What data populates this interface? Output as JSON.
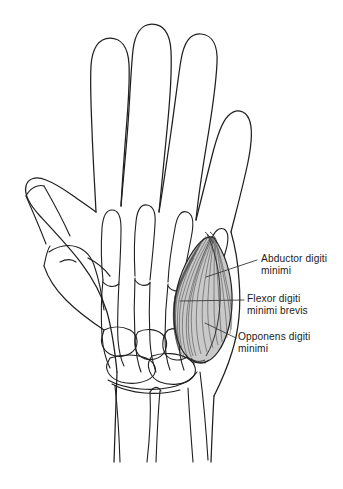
{
  "figure": {
    "view": "palmar view of right hand skeleton with hand outline",
    "background_color": "#ffffff",
    "ink_color": "#1a1a1a",
    "muscle_fill_color": "#b4b4b4"
  },
  "labels": [
    {
      "id": "abductor",
      "name": "abductor-digiti-minimi",
      "line1": "Abductor digiti",
      "line2": "minimi",
      "full_text": "Abductor digiti minimi",
      "leader": {
        "x1": 206,
        "y1": 277,
        "x2": 257,
        "y2": 260
      }
    },
    {
      "id": "flexor",
      "name": "flexor-digiti-minimi-brevis",
      "line1": "Flexor digiti",
      "line2": "minimi brevis",
      "full_text": "Flexor digiti minimi brevis",
      "leader": {
        "x1": 180,
        "y1": 301,
        "x2": 244,
        "y2": 300
      }
    },
    {
      "id": "opponens",
      "name": "opponens-digiti-minimi",
      "line1": "Opponens digiti",
      "line2": "minimi",
      "full_text": "Opponens digiti minimi",
      "leader": {
        "x1": 205,
        "y1": 323,
        "x2": 236,
        "y2": 338
      }
    }
  ],
  "structures": {
    "hand_outline": "skin silhouette of hand with five digits",
    "skeleton": "phalanges, metacarpals, carpal bones, radius and ulna",
    "muscle_group": "hypothenar eminence, striated fibre shading"
  }
}
